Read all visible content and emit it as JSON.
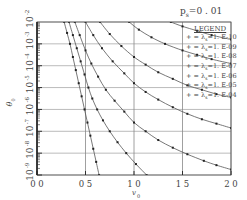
{
  "chart_data": {
    "type": "line",
    "title_main": "p",
    "title_sub": "s",
    "title_value": "=0 . 01",
    "xlabel": "v0",
    "ylabel": "θ0",
    "x_ticks": [
      "0.0",
      "0.5",
      "1.0",
      "1.5",
      "2.0"
    ],
    "x_tick_labels": [
      "0 0",
      "0 5",
      "1 0",
      "1 5",
      "2 0"
    ],
    "y_ticks": [
      "10^-2",
      "10^-3",
      "10^-4",
      "10^-5",
      "10^-6",
      "10^-7",
      "10^-8",
      "10^-9"
    ],
    "y_tick_exponents": [
      "-2",
      "-3",
      "-4",
      "-5",
      "-6",
      "-7",
      "-8",
      "-9"
    ],
    "xlim": [
      0.0,
      2.0
    ],
    "ylim_log10": [
      -9,
      -2
    ],
    "yscale": "log",
    "grid": true,
    "legend_title": "LEGEND",
    "legend_position": "upper right (inside)",
    "series": [
      {
        "name": "λs=1.E-10",
        "label_prefix": "λ",
        "label_sub": "s",
        "label_value": "=1. E-10",
        "points": [
          [
            0.28,
            -2
          ],
          [
            0.31,
            -2.5
          ],
          [
            0.34,
            -3
          ],
          [
            0.37,
            -3.6
          ],
          [
            0.4,
            -4.2
          ],
          [
            0.43,
            -4.8
          ],
          [
            0.46,
            -5.4
          ],
          [
            0.49,
            -6.0
          ],
          [
            0.52,
            -6.6
          ],
          [
            0.55,
            -7.2
          ],
          [
            0.58,
            -7.8
          ],
          [
            0.61,
            -8.4
          ],
          [
            0.64,
            -9.0
          ]
        ]
      },
      {
        "name": "λs=1.E-09",
        "label_prefix": "λ",
        "label_sub": "s",
        "label_value": "=1. E-09",
        "points": [
          [
            0.33,
            -2
          ],
          [
            0.37,
            -2.6
          ],
          [
            0.41,
            -3.2
          ],
          [
            0.45,
            -3.8
          ],
          [
            0.49,
            -4.4
          ],
          [
            0.53,
            -5.0
          ],
          [
            0.57,
            -5.5
          ],
          [
            0.62,
            -6.0
          ],
          [
            0.68,
            -6.5
          ],
          [
            0.75,
            -7.0
          ],
          [
            0.83,
            -7.5
          ],
          [
            0.92,
            -8.0
          ],
          [
            1.02,
            -8.5
          ],
          [
            1.13,
            -9.0
          ]
        ]
      },
      {
        "name": "λs=1.E-08",
        "label_prefix": "λ",
        "label_sub": "s",
        "label_value": "=1. E-08",
        "points": [
          [
            0.39,
            -2
          ],
          [
            0.44,
            -2.6
          ],
          [
            0.5,
            -3.3
          ],
          [
            0.56,
            -3.9
          ],
          [
            0.63,
            -4.5
          ],
          [
            0.71,
            -5.1
          ],
          [
            0.8,
            -5.6
          ],
          [
            0.9,
            -6.1
          ],
          [
            1.0,
            -6.6
          ],
          [
            1.12,
            -7.0
          ],
          [
            1.25,
            -7.4
          ],
          [
            1.4,
            -7.75
          ],
          [
            1.55,
            -8.05
          ],
          [
            1.72,
            -8.35
          ],
          [
            1.85,
            -8.55
          ],
          [
            2.0,
            -8.75
          ]
        ]
      },
      {
        "name": "λs=1.E-07",
        "label_prefix": "λ",
        "label_sub": "s",
        "label_value": "=1. E-07",
        "points": [
          [
            0.5,
            -2
          ],
          [
            0.58,
            -2.6
          ],
          [
            0.67,
            -3.2
          ],
          [
            0.78,
            -3.8
          ],
          [
            0.9,
            -4.35
          ],
          [
            1.0,
            -4.8
          ],
          [
            1.12,
            -5.2
          ],
          [
            1.25,
            -5.55
          ],
          [
            1.4,
            -5.9
          ],
          [
            1.55,
            -6.2
          ],
          [
            1.7,
            -6.45
          ],
          [
            1.85,
            -6.65
          ],
          [
            2.0,
            -6.85
          ]
        ]
      },
      {
        "name": "λs=1.E-06",
        "label_prefix": "λ",
        "label_sub": "s",
        "label_value": "=1. E-06",
        "points": [
          [
            0.65,
            -2
          ],
          [
            0.75,
            -2.55
          ],
          [
            0.87,
            -3.1
          ],
          [
            1.0,
            -3.6
          ],
          [
            1.12,
            -3.95
          ],
          [
            1.25,
            -4.3
          ],
          [
            1.4,
            -4.6
          ],
          [
            1.55,
            -4.9
          ],
          [
            1.7,
            -5.1
          ],
          [
            1.85,
            -5.3
          ],
          [
            2.0,
            -5.45
          ]
        ]
      },
      {
        "name": "λs=1.E-05",
        "label_prefix": "λ",
        "label_sub": "s",
        "label_value": "=1. E-05",
        "points": [
          [
            0.95,
            -2
          ],
          [
            1.05,
            -2.35
          ],
          [
            1.18,
            -2.7
          ],
          [
            1.32,
            -3.0
          ],
          [
            1.5,
            -3.3
          ],
          [
            1.65,
            -3.5
          ],
          [
            1.8,
            -3.7
          ],
          [
            2.0,
            -3.9
          ]
        ]
      },
      {
        "name": "λs=1.E-04",
        "label_prefix": "λ",
        "label_sub": "s",
        "label_value": "=1. E-04",
        "points": [
          [
            1.38,
            -2
          ],
          [
            1.5,
            -2.2
          ],
          [
            1.65,
            -2.4
          ],
          [
            1.8,
            -2.6
          ],
          [
            2.0,
            -2.8
          ]
        ]
      }
    ]
  },
  "colors": {
    "axis": "#555555",
    "grid": "#bbbbbb",
    "curve": "#555555",
    "marker": "#222222",
    "text": "#444444"
  }
}
